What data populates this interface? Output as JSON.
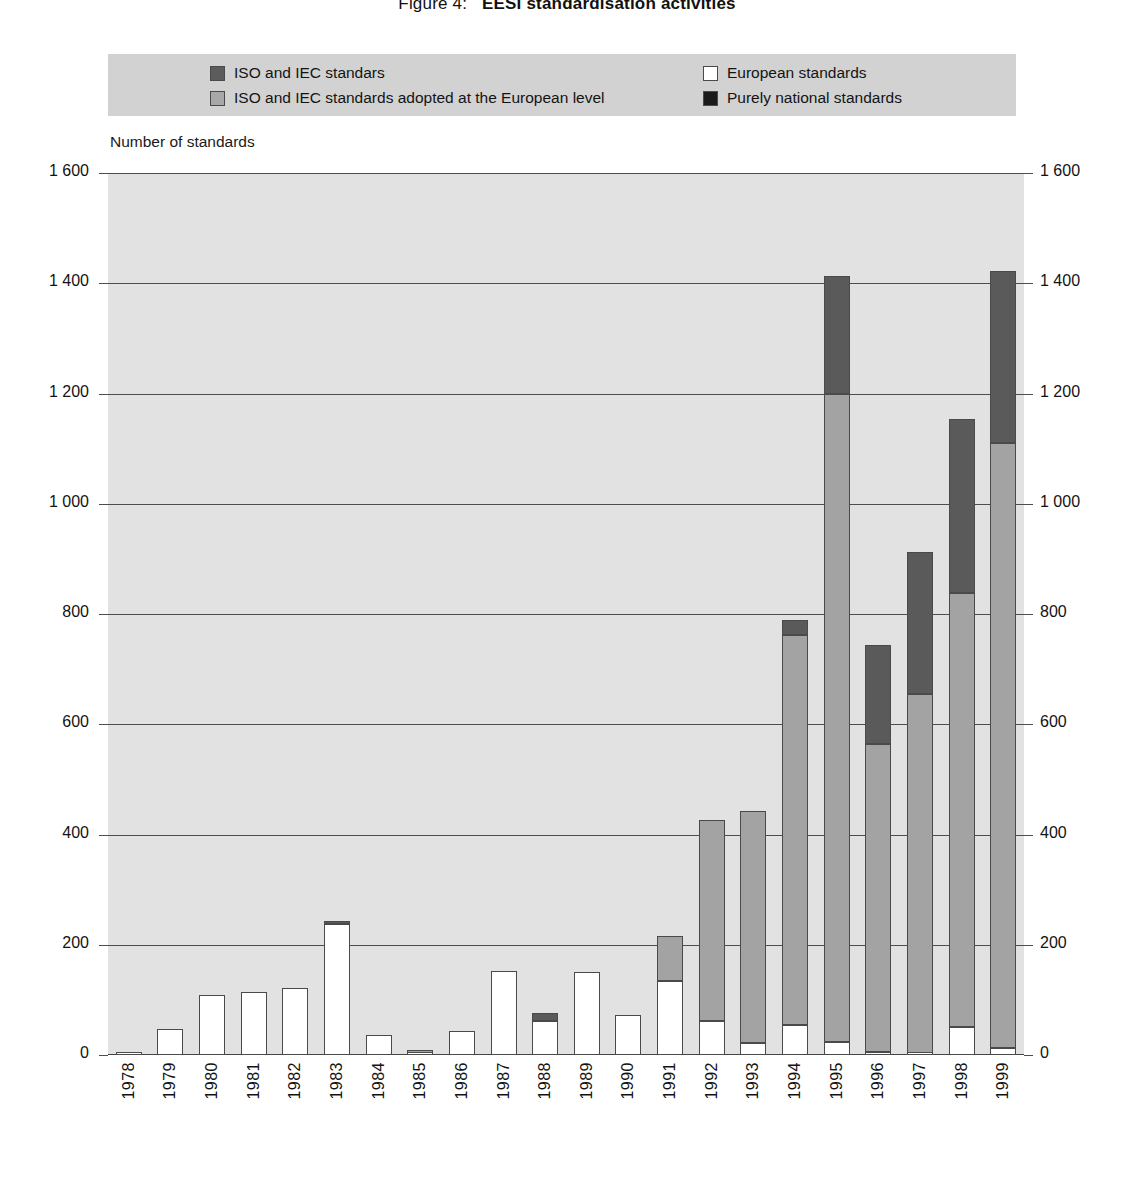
{
  "title": {
    "number": "Figure 4:",
    "text": "EESI standardisation activities",
    "full": "Figure 4:  EESI standardisation activities"
  },
  "axis_caption": "Number of standards",
  "legend": {
    "items": [
      {
        "key": "iso",
        "label": "ISO and IEC standars",
        "color": "#5c5c5c",
        "column": "left",
        "row": 0
      },
      {
        "key": "iso_eu",
        "label": "ISO and IEC standards adopted at the European level",
        "color": "#a8a8a8",
        "column": "left",
        "row": 1
      },
      {
        "key": "european",
        "label": "European standards",
        "color": "#ffffff",
        "column": "right",
        "row": 0
      },
      {
        "key": "national",
        "label": "Purely national standards",
        "color": "#1a1a1a",
        "column": "right",
        "row": 1
      }
    ]
  },
  "y_axis": {
    "ticks": [
      "1 600",
      "1 400",
      "1 200",
      "1 000",
      "800",
      "600",
      "400",
      "200",
      "0"
    ],
    "tick_values": [
      1600,
      1400,
      1200,
      1000,
      800,
      600,
      400,
      200,
      0
    ],
    "min": 0,
    "max": 1600,
    "step": 200
  },
  "chart_data": {
    "type": "bar",
    "subtype": "stacked",
    "xlabel": "",
    "ylabel": "Number of standards",
    "ylim": [
      0,
      1600
    ],
    "grid": true,
    "legend_position": "top",
    "categories": [
      "1978",
      "1979",
      "1980",
      "1981",
      "1982",
      "1983",
      "1984",
      "1985",
      "1986",
      "1987",
      "1988",
      "1989",
      "1990",
      "1991",
      "1992",
      "1993",
      "1994",
      "1995",
      "1996",
      "1997",
      "1998",
      "1999"
    ],
    "series": [
      {
        "name": "European standards",
        "color": "#ffffff",
        "values": [
          6,
          48,
          108,
          114,
          122,
          238,
          36,
          4,
          44,
          152,
          62,
          150,
          72,
          134,
          62,
          22,
          54,
          24,
          6,
          4,
          50,
          12
        ]
      },
      {
        "name": "ISO and IEC standards adopted at the European level",
        "color": "#a3a3a3",
        "values": [
          0,
          0,
          0,
          0,
          0,
          0,
          0,
          4,
          0,
          0,
          0,
          0,
          0,
          82,
          364,
          420,
          708,
          1176,
          558,
          650,
          788,
          1098
        ]
      },
      {
        "name": "ISO and IEC standars",
        "color": "#5a5a5a",
        "values": [
          0,
          0,
          0,
          0,
          0,
          2,
          0,
          0,
          0,
          0,
          14,
          0,
          0,
          0,
          0,
          0,
          28,
          214,
          180,
          258,
          316,
          312
        ]
      },
      {
        "name": "Purely national standards",
        "color": "#1f1f1f",
        "values": [
          0,
          0,
          0,
          0,
          0,
          0,
          0,
          0,
          0,
          0,
          0,
          0,
          0,
          0,
          0,
          0,
          0,
          0,
          0,
          0,
          0,
          0
        ]
      }
    ],
    "totals": [
      6,
      48,
      108,
      114,
      122,
      240,
      36,
      8,
      44,
      152,
      76,
      150,
      72,
      216,
      426,
      442,
      790,
      1414,
      744,
      912,
      1154,
      1422
    ]
  }
}
